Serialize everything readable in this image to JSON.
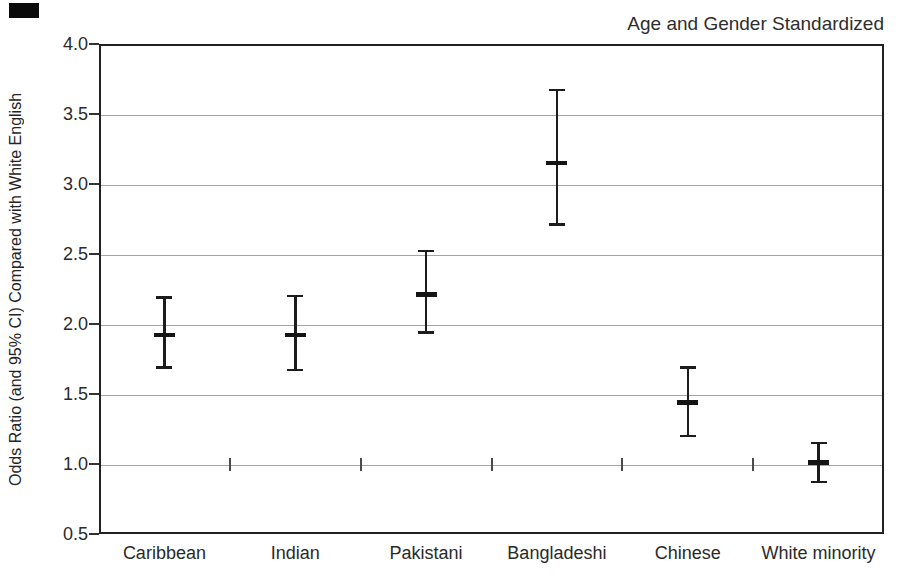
{
  "title": "Age and Gender Standardized",
  "chart_data": {
    "type": "scatter",
    "subtype": "point-estimates-with-error-bars",
    "title": "Age and Gender Standardized",
    "xlabel": "",
    "ylabel": "Odds Ratio (and 95% CI) Compared with White English",
    "categories": [
      "Caribbean",
      "Indian",
      "Pakistani",
      "Bangladeshi",
      "Chinese",
      "White minority"
    ],
    "series": [
      {
        "name": "Odds ratio (and 95% CI)",
        "points": [
          {
            "category": "Caribbean",
            "odds_ratio": 1.92,
            "ci_low": 1.69,
            "ci_high": 2.19
          },
          {
            "category": "Indian",
            "odds_ratio": 1.92,
            "ci_low": 1.67,
            "ci_high": 2.2
          },
          {
            "category": "Pakistani",
            "odds_ratio": 2.21,
            "ci_low": 1.94,
            "ci_high": 2.52
          },
          {
            "category": "Bangladeshi",
            "odds_ratio": 3.15,
            "ci_low": 2.71,
            "ci_high": 3.67
          },
          {
            "category": "Chinese",
            "odds_ratio": 1.44,
            "ci_low": 1.2,
            "ci_high": 1.69
          },
          {
            "category": "White minority",
            "odds_ratio": 1.01,
            "ci_low": 0.87,
            "ci_high": 1.15
          }
        ]
      }
    ],
    "ylim": [
      0.5,
      4.0
    ],
    "y_tick_labels": [
      "4.0",
      "3.5",
      "3.0",
      "2.5",
      "2.0",
      "1.5",
      "1.0",
      "0.5"
    ],
    "y_tick_values": [
      4.0,
      3.5,
      3.0,
      2.5,
      2.0,
      1.5,
      1.0,
      0.5
    ],
    "reference_line": 1.0,
    "grid": "horizontal light-gray lines at 0.5 intervals",
    "legend": "none"
  },
  "colors": {
    "background": "#ffffff",
    "frame": "#222222",
    "gridline": "#a3a3a3",
    "marker": "#1c1c1c",
    "text": "#2a2a2a",
    "scan_artifact": "#0a0a0a"
  }
}
